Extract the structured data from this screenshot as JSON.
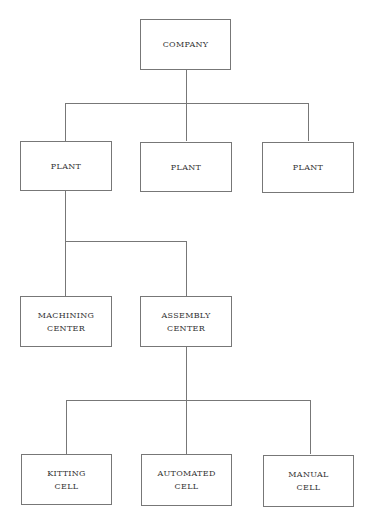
{
  "diagram": {
    "type": "org-chart",
    "root": {
      "lines": [
        "COMPANY"
      ]
    },
    "plants": [
      {
        "lines": [
          "PLANT"
        ]
      },
      {
        "lines": [
          "PLANT"
        ]
      },
      {
        "lines": [
          "PLANT"
        ]
      }
    ],
    "centers": [
      {
        "lines": [
          "MACHINING",
          "CENTER"
        ]
      },
      {
        "lines": [
          "ASSEMBLY",
          "CENTER"
        ]
      }
    ],
    "cells": [
      {
        "lines": [
          "KITTING",
          "CELL"
        ]
      },
      {
        "lines": [
          "AUTOMATED",
          "CELL"
        ]
      },
      {
        "lines": [
          "MANUAL",
          "CELL"
        ]
      }
    ],
    "colors": {
      "line": "#777777",
      "text": "#333333",
      "background": "#ffffff"
    }
  }
}
